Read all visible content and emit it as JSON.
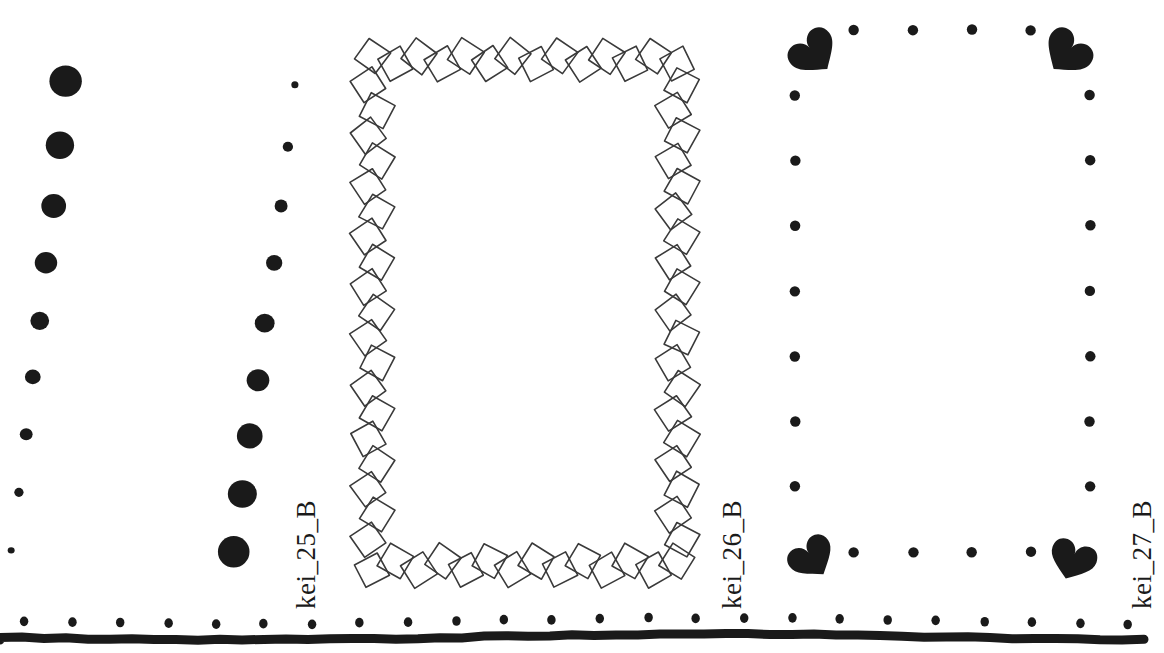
{
  "page": {
    "background_color": "#ffffff",
    "ink_color": "#1a1a1a",
    "width": 1164,
    "height": 653,
    "type": "decorative-border-pattern-sheet"
  },
  "specimens": [
    {
      "id": "kei_25_B",
      "label": "kei_25_B",
      "caption_rotation_deg": -90,
      "description": "two vertical columns of graduated solid circles",
      "ink_color": "#1a1a1a"
    },
    {
      "id": "kei_26_B",
      "label": "kei_26_B",
      "caption_rotation_deg": -90,
      "description": "rectangular frame built from a chain of overlapping outlined diamonds",
      "ink_color": "#3a3a3a"
    },
    {
      "id": "kei_27_B",
      "label": "kei_27_B",
      "caption_rotation_deg": -90,
      "description": "dotted rectangular frame with solid heart ornaments at the four corners",
      "ink_color": "#1a1a1a"
    }
  ],
  "pattern_a_columns": [
    {
      "name": "column-left-descending",
      "dots": [
        {
          "cx": 66,
          "cy": 81,
          "r": 16
        },
        {
          "cx": 60,
          "cy": 145,
          "r": 14
        },
        {
          "cx": 54,
          "cy": 206,
          "r": 12.5
        },
        {
          "cx": 46,
          "cy": 263,
          "r": 11
        },
        {
          "cx": 40,
          "cy": 321,
          "r": 9.5
        },
        {
          "cx": 33,
          "cy": 377,
          "r": 7.8
        },
        {
          "cx": 26,
          "cy": 434,
          "r": 6.2
        },
        {
          "cx": 19,
          "cy": 492,
          "r": 4.8
        },
        {
          "cx": 11,
          "cy": 550,
          "r": 3.4
        }
      ]
    },
    {
      "name": "column-right-ascending",
      "dots": [
        {
          "cx": 295,
          "cy": 85,
          "r": 3.6
        },
        {
          "cx": 288,
          "cy": 147,
          "r": 5.2
        },
        {
          "cx": 281,
          "cy": 206,
          "r": 6.6
        },
        {
          "cx": 274,
          "cy": 263,
          "r": 8.2
        },
        {
          "cx": 265,
          "cy": 323,
          "r": 9.8
        },
        {
          "cx": 258,
          "cy": 380,
          "r": 11.4
        },
        {
          "cx": 250,
          "cy": 436,
          "r": 13
        },
        {
          "cx": 242,
          "cy": 494,
          "r": 14.4
        },
        {
          "cx": 234,
          "cy": 552,
          "r": 16
        }
      ]
    }
  ],
  "pattern_b_frame": {
    "name": "diamond-chain-frame",
    "rect": {
      "x": 372,
      "y": 60,
      "width": 305,
      "height": 505
    },
    "diamond_size": 26,
    "diamond_count_top": 13,
    "diamond_count_side": 20,
    "stroke_width": 1.6,
    "stroke_color": "#3a3a3a",
    "fill": "none"
  },
  "pattern_c_frame": {
    "name": "heart-corner-dotted-frame",
    "rect": {
      "x": 795,
      "y": 30,
      "width": 295,
      "height": 522
    },
    "dot_radius": 5.2,
    "dots_top": 4,
    "dots_bottom": 4,
    "dots_left": 7,
    "dots_right": 7,
    "corner_hearts": [
      {
        "position": "top-left",
        "cx": 803,
        "cy": 40,
        "size": 70,
        "rotation_deg": -40
      },
      {
        "position": "top-right",
        "cx": 1078,
        "cy": 40,
        "size": 70,
        "rotation_deg": 40
      },
      {
        "position": "bottom-left",
        "cx": 803,
        "cy": 545,
        "size": 66,
        "rotation_deg": -35
      },
      {
        "position": "bottom-right",
        "cx": 1078,
        "cy": 545,
        "size": 66,
        "rotation_deg": 20
      }
    ]
  },
  "bottom_rule": {
    "name": "dotted-baseline-rule",
    "line_y": 637,
    "line_thickness": 9,
    "dot_radius": 4.6,
    "dot_count": 24,
    "dot_start_x": 24,
    "dot_spacing": 48,
    "dot_y": 621
  }
}
